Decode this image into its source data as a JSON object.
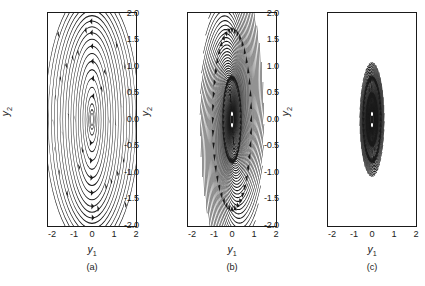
{
  "figure": {
    "background": "#ffffff",
    "line_color": "#1a1a1a",
    "panel_count": 3
  },
  "axes": {
    "xlabel": "y",
    "xlabel_sub": "1",
    "ylabel": "y",
    "ylabel_sub": "2",
    "xticks": [
      "-2",
      "-1",
      "0",
      "1",
      "2"
    ],
    "yticks": [
      "2.0",
      "1.5",
      "1.0",
      "0.5",
      "0.0",
      "-0.5",
      "-1.0",
      "-1.5",
      "-2.0"
    ],
    "xlim": [
      -2,
      2
    ],
    "ylim": [
      -2,
      2
    ]
  },
  "panels": [
    {
      "caption": "(a)",
      "type": "center",
      "equilibrium": [
        0,
        0
      ]
    },
    {
      "caption": "(b)",
      "type": "unstable-spiral",
      "equilibrium": [
        0,
        0
      ]
    },
    {
      "caption": "(c)",
      "type": "unstable-spiral",
      "equilibrium": [
        0,
        0
      ]
    }
  ],
  "chart_data": {
    "type": "line",
    "title": "",
    "xlabel": "y_1",
    "ylabel": "y_2",
    "xlim": [
      -2,
      2
    ],
    "ylim": [
      -2,
      2
    ],
    "grid": false,
    "legend": null,
    "subplots": [
      {
        "caption": "(a)",
        "kind": "phase-portrait",
        "classification": "center (neutrally stable closed orbits)",
        "flow_direction": "clockwise",
        "equilibrium_point": [
          0.0,
          0.0
        ],
        "orbit_semi_axes_x": [
          0.07,
          0.14,
          0.22,
          0.33,
          0.45,
          0.58,
          0.72,
          0.86,
          1.0,
          1.14,
          1.28,
          1.42,
          1.56,
          1.7,
          1.85,
          2.0
        ],
        "orbit_semi_axes_y": [
          0.14,
          0.28,
          0.44,
          0.66,
          0.9,
          1.1,
          1.32,
          1.5,
          1.66,
          1.8,
          1.92,
          2.0,
          2.08,
          2.16,
          2.24,
          2.32
        ],
        "streamline_count": 16,
        "arrow_count": 52
      },
      {
        "caption": "(b)",
        "kind": "phase-portrait",
        "classification": "unstable spiral (spiral source)",
        "flow_direction": "outward clockwise",
        "equilibrium_point": [
          0.0,
          0.0
        ],
        "spiral_tightness": 0.33,
        "streamline_count": 44,
        "arrow_count": 60
      },
      {
        "caption": "(c)",
        "kind": "phase-portrait",
        "classification": "unstable spiral (spiral source, tighter)",
        "flow_direction": "outward clockwise",
        "equilibrium_point": [
          0.0,
          0.0
        ],
        "spiral_tightness": 0.22,
        "streamline_count": 44,
        "arrow_count": 58
      }
    ]
  }
}
